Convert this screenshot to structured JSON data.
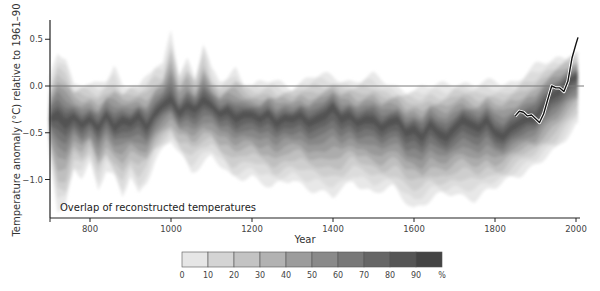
{
  "chart_data": {
    "type": "area",
    "title": "",
    "annotation": "Overlap of reconstructed temperatures",
    "xlabel": "Year",
    "ylabel": "Temperature anomaly (°C) relative to 1961–90",
    "xlim": [
      700,
      2010
    ],
    "ylim": [
      -1.4,
      0.7
    ],
    "x_ticks": [
      800,
      1000,
      1200,
      1400,
      1600,
      1800,
      2000
    ],
    "y_ticks": [
      0.5,
      0.0,
      -0.5,
      -1.0
    ],
    "y_tick_labels": [
      "0.5",
      "0.0",
      "−0.5",
      "−1.0"
    ],
    "reference_line": {
      "y": 0.0,
      "color": "#7a7a7a"
    },
    "grid": false,
    "legend": {
      "position": "bottom-center",
      "title": "",
      "unit": "%",
      "labels": [
        "0",
        "10",
        "20",
        "30",
        "40",
        "50",
        "60",
        "70",
        "80",
        "90",
        "%"
      ],
      "colors": [
        "#e6e6e6",
        "#d4d4d4",
        "#c3c3c3",
        "#b2b2b2",
        "#9c9c9c",
        "#8a8a8a",
        "#787878",
        "#666666",
        "#555555",
        "#444444"
      ]
    },
    "series": [
      {
        "name": "Reconstruction overlap (central band ~50% density)",
        "x": [
          700,
          720,
          740,
          760,
          780,
          800,
          820,
          840,
          860,
          880,
          900,
          920,
          940,
          960,
          980,
          1000,
          1020,
          1040,
          1060,
          1080,
          1100,
          1120,
          1140,
          1160,
          1180,
          1200,
          1220,
          1240,
          1260,
          1280,
          1300,
          1320,
          1340,
          1360,
          1380,
          1400,
          1420,
          1440,
          1460,
          1480,
          1500,
          1520,
          1540,
          1560,
          1580,
          1600,
          1620,
          1640,
          1660,
          1680,
          1700,
          1720,
          1740,
          1760,
          1780,
          1800,
          1820,
          1840,
          1860,
          1880,
          1900,
          1920,
          1940,
          1960,
          1980,
          2000
        ],
        "values": [
          -0.35,
          -0.3,
          -0.4,
          -0.32,
          -0.42,
          -0.35,
          -0.45,
          -0.3,
          -0.45,
          -0.35,
          -0.4,
          -0.3,
          -0.45,
          -0.3,
          -0.2,
          -0.15,
          -0.3,
          -0.2,
          -0.25,
          -0.15,
          -0.2,
          -0.3,
          -0.25,
          -0.35,
          -0.3,
          -0.3,
          -0.35,
          -0.28,
          -0.4,
          -0.33,
          -0.35,
          -0.3,
          -0.4,
          -0.35,
          -0.3,
          -0.2,
          -0.35,
          -0.3,
          -0.4,
          -0.35,
          -0.35,
          -0.45,
          -0.38,
          -0.35,
          -0.5,
          -0.45,
          -0.55,
          -0.4,
          -0.5,
          -0.55,
          -0.45,
          -0.35,
          -0.4,
          -0.45,
          -0.35,
          -0.5,
          -0.55,
          -0.45,
          -0.4,
          -0.35,
          -0.35,
          -0.2,
          -0.1,
          -0.05,
          0.05,
          0.1
        ]
      },
      {
        "name": "Reconstruction envelope upper (10%)",
        "x": [
          700,
          720,
          740,
          760,
          780,
          800,
          820,
          840,
          860,
          880,
          900,
          920,
          940,
          960,
          980,
          1000,
          1020,
          1040,
          1060,
          1080,
          1100,
          1120,
          1140,
          1160,
          1180,
          1200,
          1250,
          1300,
          1350,
          1400,
          1450,
          1500,
          1550,
          1600,
          1650,
          1700,
          1750,
          1800,
          1850,
          1900,
          1950,
          2000
        ],
        "values": [
          0.05,
          0.35,
          0.3,
          0.02,
          0.05,
          0.02,
          0.0,
          0.05,
          0.2,
          0.0,
          0.05,
          0.0,
          0.1,
          0.2,
          0.2,
          0.6,
          0.15,
          0.3,
          0.1,
          0.45,
          0.15,
          0.05,
          0.1,
          0.2,
          0.05,
          0.0,
          0.05,
          0.0,
          0.1,
          0.1,
          0.05,
          0.1,
          0.0,
          -0.05,
          0.0,
          0.05,
          0.0,
          0.05,
          0.05,
          0.2,
          0.3,
          0.35
        ]
      },
      {
        "name": "Reconstruction envelope lower (10%)",
        "x": [
          700,
          720,
          740,
          760,
          780,
          800,
          820,
          840,
          860,
          880,
          900,
          920,
          940,
          960,
          980,
          1000,
          1050,
          1100,
          1150,
          1200,
          1250,
          1300,
          1350,
          1400,
          1450,
          1500,
          1550,
          1600,
          1650,
          1700,
          1750,
          1800,
          1850,
          1900,
          1950,
          2000
        ],
        "values": [
          -0.75,
          -1.35,
          -1.3,
          -0.9,
          -0.95,
          -0.8,
          -1.1,
          -0.9,
          -1.0,
          -1.2,
          -0.95,
          -1.15,
          -1.0,
          -0.8,
          -0.7,
          -0.6,
          -0.9,
          -0.75,
          -1.0,
          -0.95,
          -1.1,
          -1.0,
          -1.1,
          -1.2,
          -1.0,
          -1.15,
          -1.1,
          -1.3,
          -1.2,
          -1.15,
          -1.2,
          -1.1,
          -0.95,
          -0.85,
          -0.7,
          -0.4
        ]
      },
      {
        "name": "Instrumental record",
        "color": "#111111",
        "x": [
          1850,
          1860,
          1870,
          1880,
          1890,
          1900,
          1910,
          1920,
          1930,
          1940,
          1950,
          1960,
          1970,
          1980,
          1990,
          2000,
          2005
        ],
        "values": [
          -0.32,
          -0.27,
          -0.28,
          -0.32,
          -0.31,
          -0.35,
          -0.39,
          -0.3,
          -0.15,
          0.0,
          -0.02,
          -0.02,
          -0.06,
          0.05,
          0.3,
          0.45,
          0.52
        ]
      }
    ]
  }
}
